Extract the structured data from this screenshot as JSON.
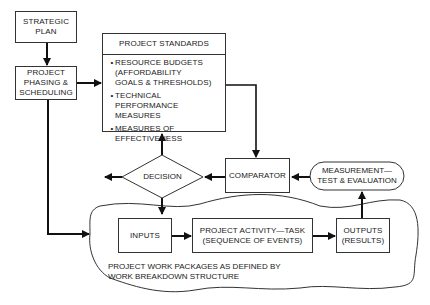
{
  "diagram": {
    "nodes": {
      "strategic_plan": {
        "label": "STRATEGIC\nPLAN"
      },
      "phasing": {
        "label": "PROJECT\nPHASING &\nSCHEDULING"
      },
      "standards": {
        "title": "PROJECT STANDARDS",
        "items": [
          {
            "bullet": "•",
            "text": "RESOURCE BUDGETS\n(AFFORDABILITY\nGOALS & THRESHOLDS)"
          },
          {
            "bullet": "•",
            "text": "TECHNICAL\nPERFORMANCE MEASURES"
          },
          {
            "bullet": "•",
            "text": "MEASURES OF\nEFFECTIVENESS"
          }
        ]
      },
      "decision": {
        "label": "DECISION"
      },
      "comparator": {
        "label": "COMPARATOR"
      },
      "measurement": {
        "label": "MEASUREMENT—\nTEST & EVALUATION"
      },
      "inputs": {
        "label": "INPUTS"
      },
      "activity": {
        "label": "PROJECT ACTIVITY—TASK\n(SEQUENCE OF EVENTS)"
      },
      "outputs": {
        "label": "OUTPUTS\n(RESULTS)"
      },
      "work_packages": {
        "label": "PROJECT WORK PACKAGES AS DEFINED BY\nWORK BREAKDOWN STRUCTURE"
      }
    },
    "edges": [
      {
        "from": "strategic_plan",
        "to": "phasing"
      },
      {
        "from": "phasing",
        "to": "standards"
      },
      {
        "from": "phasing",
        "to": "work_packages"
      },
      {
        "from": "standards",
        "to": "comparator"
      },
      {
        "from": "decision",
        "to": "standards"
      },
      {
        "from": "decision",
        "to": "left-exit"
      },
      {
        "from": "decision",
        "to": "work_packages"
      },
      {
        "from": "comparator",
        "to": "decision"
      },
      {
        "from": "measurement",
        "to": "comparator"
      },
      {
        "from": "outputs",
        "to": "measurement"
      },
      {
        "from": "inputs",
        "to": "activity"
      },
      {
        "from": "activity",
        "to": "outputs"
      }
    ]
  }
}
